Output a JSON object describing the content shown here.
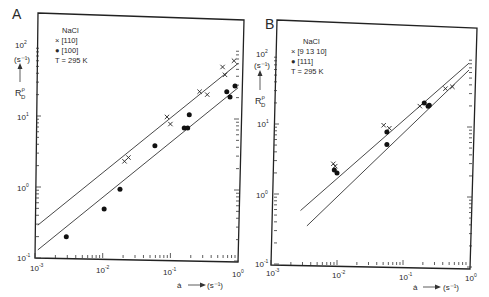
{
  "chart_data": [
    {
      "panel": "A",
      "type": "scatter",
      "title": "",
      "xlabel": "ȧ → (s⁻¹)",
      "ylabel": "R_D^ρ (s⁻¹)",
      "xscale": "log",
      "yscale": "log",
      "xlim": [
        0.001,
        1
      ],
      "ylim": [
        0.1,
        200
      ],
      "x_ticks": [
        "10⁻³",
        "10⁻²",
        "10⁻¹",
        "10⁰"
      ],
      "y_ticks": [
        "10⁻¹",
        "10⁰",
        "10¹",
        "10²"
      ],
      "grid": false,
      "legend": {
        "position": "upper-left",
        "title": "NaCl",
        "entries": [
          {
            "marker": "x",
            "label": "[110]"
          },
          {
            "marker": "●",
            "label": "[100]"
          }
        ],
        "note": "T = 295 K"
      },
      "series": [
        {
          "name": "[110]",
          "marker": "x",
          "points": [
            [
              0.021,
              2.3
            ],
            [
              0.024,
              2.6
            ],
            [
              0.089,
              9.7
            ],
            [
              0.1,
              7.7
            ],
            [
              0.27,
              22
            ],
            [
              0.35,
              20
            ],
            [
              0.59,
              49
            ],
            [
              0.64,
              38
            ],
            [
              0.87,
              60
            ]
          ]
        },
        {
          "name": "[100]",
          "marker": "dot",
          "points": [
            [
              0.0029,
              0.2
            ],
            [
              0.0105,
              0.49
            ],
            [
              0.018,
              0.93
            ],
            [
              0.059,
              3.8
            ],
            [
              0.16,
              6.8
            ],
            [
              0.18,
              6.8
            ],
            [
              0.19,
              10.4
            ],
            [
              0.68,
              22
            ],
            [
              0.76,
              18.5
            ],
            [
              0.9,
              26.5
            ]
          ]
        }
      ],
      "fit_lines": [
        {
          "name": "[110] fit",
          "from": [
            0.0011,
            0.29
          ],
          "to": [
            1.0,
            55
          ]
        },
        {
          "name": "[100] fit",
          "from": [
            0.0011,
            0.13
          ],
          "to": [
            1.0,
            25
          ]
        }
      ]
    },
    {
      "panel": "B",
      "type": "scatter",
      "title": "",
      "xlabel": "ȧ → (s⁻¹)",
      "ylabel": "R_D^ρ (s⁻¹)",
      "xscale": "log",
      "yscale": "log",
      "xlim": [
        0.001,
        1
      ],
      "ylim": [
        0.1,
        200
      ],
      "x_ticks": [
        "10⁻³",
        "10⁻²",
        "10⁻¹",
        "10⁰"
      ],
      "y_ticks": [
        "10⁻¹",
        "10⁰",
        "10¹",
        "10²"
      ],
      "grid": false,
      "legend": {
        "position": "upper-left",
        "title": "NaCl",
        "entries": [
          {
            "marker": "x",
            "label": "[9 13 10]"
          },
          {
            "marker": "●",
            "label": "[111]"
          }
        ],
        "note": "T = 295 K"
      },
      "series": [
        {
          "name": "[9 13 10]",
          "marker": "x",
          "points": [
            [
              0.0088,
              2.7
            ],
            [
              0.0094,
              2.5
            ],
            [
              0.051,
              9.6
            ],
            [
              0.062,
              8.7
            ],
            [
              0.18,
              18
            ],
            [
              0.44,
              32
            ],
            [
              0.56,
              34
            ]
          ]
        },
        {
          "name": "[111]",
          "marker": "dot",
          "points": [
            [
              0.0091,
              2.2
            ],
            [
              0.01,
              2.0
            ],
            [
              0.057,
              7.7
            ],
            [
              0.057,
              5.1
            ],
            [
              0.21,
              20
            ],
            [
              0.24,
              18
            ],
            [
              0.25,
              18.5
            ]
          ]
        }
      ],
      "fit_lines": [
        {
          "name": "[9 13 10] fit",
          "from": [
            0.0028,
            0.58
          ],
          "to": [
            1.0,
            74
          ]
        },
        {
          "name": "[111] fit",
          "from": [
            0.0035,
            0.35
          ],
          "to": [
            1.0,
            59
          ]
        }
      ]
    }
  ],
  "panels": {
    "A": {
      "letter": "A",
      "legend_title": "NaCl",
      "legend_x": "× [110]",
      "legend_dot": "● [100]",
      "legend_temp": "T = 295 K",
      "y_unit": "(s⁻¹)",
      "y_symbol": "R",
      "y_sup": "ρ",
      "y_sub": "D",
      "x_symbol": "ȧ",
      "x_unit": "(s⁻¹)",
      "xticks": [
        "10",
        "10",
        "10",
        "10"
      ],
      "xticks_exp": [
        "-3",
        "-2",
        "-1",
        "0"
      ],
      "yticks": [
        "10",
        "10",
        "10",
        "10"
      ],
      "yticks_exp": [
        "2",
        "1",
        "0",
        "-1"
      ]
    },
    "B": {
      "letter": "B",
      "legend_title": "NaCl",
      "legend_x": "× [9 13 10]",
      "legend_dot": "● [111]",
      "legend_temp": "T = 295 K",
      "y_unit": "(s⁻¹)",
      "y_symbol": "R",
      "y_sup": "ρ",
      "y_sub": "D",
      "x_symbol": "ȧ",
      "x_unit": "(s⁻¹)",
      "xticks": [
        "10",
        "10",
        "10",
        "10"
      ],
      "xticks_exp": [
        "-3",
        "-2",
        "-1",
        "0"
      ],
      "yticks": [
        "10",
        "10",
        "10",
        "10"
      ],
      "yticks_exp": [
        "2",
        "1",
        "0",
        "-1"
      ]
    }
  }
}
